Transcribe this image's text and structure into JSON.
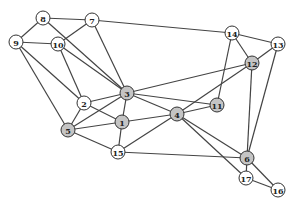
{
  "graph": {
    "colors": {
      "shaded": "#c4c4c4",
      "plain": "#ffffff"
    },
    "nodes": [
      {
        "id": "1",
        "shaded": true
      },
      {
        "id": "2",
        "shaded": false
      },
      {
        "id": "3",
        "shaded": true
      },
      {
        "id": "4",
        "shaded": true
      },
      {
        "id": "5",
        "shaded": true
      },
      {
        "id": "6",
        "shaded": true
      },
      {
        "id": "7",
        "shaded": false
      },
      {
        "id": "8",
        "shaded": false
      },
      {
        "id": "9",
        "shaded": false
      },
      {
        "id": "10",
        "shaded": false
      },
      {
        "id": "11",
        "shaded": true
      },
      {
        "id": "12",
        "shaded": true
      },
      {
        "id": "13",
        "shaded": false
      },
      {
        "id": "14",
        "shaded": false
      },
      {
        "id": "15",
        "shaded": false
      },
      {
        "id": "16",
        "shaded": false
      },
      {
        "id": "17",
        "shaded": false
      }
    ],
    "edges": [
      [
        "8",
        "7"
      ],
      [
        "8",
        "9"
      ],
      [
        "8",
        "3"
      ],
      [
        "7",
        "10"
      ],
      [
        "7",
        "3"
      ],
      [
        "7",
        "14"
      ],
      [
        "9",
        "10"
      ],
      [
        "9",
        "2"
      ],
      [
        "9",
        "5"
      ],
      [
        "10",
        "2"
      ],
      [
        "10",
        "3"
      ],
      [
        "2",
        "3"
      ],
      [
        "2",
        "1"
      ],
      [
        "2",
        "5"
      ],
      [
        "5",
        "3"
      ],
      [
        "5",
        "1"
      ],
      [
        "5",
        "15"
      ],
      [
        "3",
        "1"
      ],
      [
        "3",
        "4"
      ],
      [
        "3",
        "11"
      ],
      [
        "3",
        "12"
      ],
      [
        "1",
        "4"
      ],
      [
        "1",
        "15"
      ],
      [
        "15",
        "4"
      ],
      [
        "15",
        "6"
      ],
      [
        "4",
        "11"
      ],
      [
        "4",
        "12"
      ],
      [
        "4",
        "6"
      ],
      [
        "4",
        "17"
      ],
      [
        "11",
        "14"
      ],
      [
        "14",
        "12"
      ],
      [
        "14",
        "13"
      ],
      [
        "12",
        "13"
      ],
      [
        "12",
        "6"
      ],
      [
        "13",
        "6"
      ],
      [
        "6",
        "17"
      ],
      [
        "6",
        "16"
      ],
      [
        "17",
        "16"
      ]
    ]
  }
}
